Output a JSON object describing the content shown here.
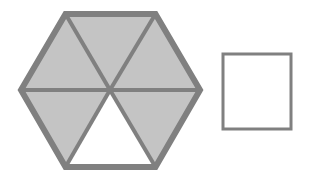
{
  "figure": {
    "background_color": "#ffffff",
    "stroke_color": "#808080",
    "shaded_fill_color": "#c4c4c4",
    "unshaded_fill_color": "#ffffff",
    "outer_stroke_width": 6,
    "inner_stroke_width": 4,
    "square_stroke_width": 3,
    "shapes": [
      {
        "name": "hexagon",
        "kind": "regular-hexagon",
        "orientation": "flat-top",
        "center": {
          "x": 110,
          "y": 90
        },
        "vertices": [
          {
            "label": "left",
            "x": 21,
            "y": 90
          },
          {
            "label": "top-left",
            "x": 65.5,
            "y": 14
          },
          {
            "label": "top-right",
            "x": 155.5,
            "y": 14
          },
          {
            "label": "right",
            "x": 200,
            "y": 90
          },
          {
            "label": "bottom-right",
            "x": 155.5,
            "y": 167
          },
          {
            "label": "bottom-left",
            "x": 65.5,
            "y": 167
          }
        ],
        "triangle_count": 6,
        "shaded_count": 5,
        "unshaded_count": 1,
        "triangles": [
          {
            "name": "upper-left-triangle",
            "shaded": true,
            "points": "21,90 65.5,14 110,90"
          },
          {
            "name": "top-triangle",
            "shaded": true,
            "points": "65.5,14 155.5,14 110,90"
          },
          {
            "name": "upper-right-triangle",
            "shaded": true,
            "points": "155.5,14 200,90 110,90"
          },
          {
            "name": "lower-right-triangle",
            "shaded": true,
            "points": "200,90 155.5,167 110,90"
          },
          {
            "name": "bottom-triangle",
            "shaded": false,
            "points": "155.5,167 65.5,167 110,90"
          },
          {
            "name": "lower-left-triangle",
            "shaded": true,
            "points": "65.5,167 21,90 110,90"
          }
        ],
        "divider_lines": [
          {
            "name": "horizontal-divider",
            "x1": 21,
            "y1": 90,
            "x2": 200,
            "y2": 90
          },
          {
            "name": "upper-left-divider",
            "x1": 110,
            "y1": 90,
            "x2": 65.5,
            "y2": 14
          },
          {
            "name": "upper-right-divider",
            "x1": 110,
            "y1": 90,
            "x2": 155.5,
            "y2": 14
          },
          {
            "name": "lower-left-divider",
            "x1": 110,
            "y1": 90,
            "x2": 65.5,
            "y2": 167
          },
          {
            "name": "lower-right-divider",
            "x1": 110,
            "y1": 90,
            "x2": 155.5,
            "y2": 167
          }
        ]
      },
      {
        "name": "square",
        "kind": "square",
        "shaded": false,
        "x": 223,
        "y": 54,
        "width": 68,
        "height": 75
      }
    ]
  }
}
